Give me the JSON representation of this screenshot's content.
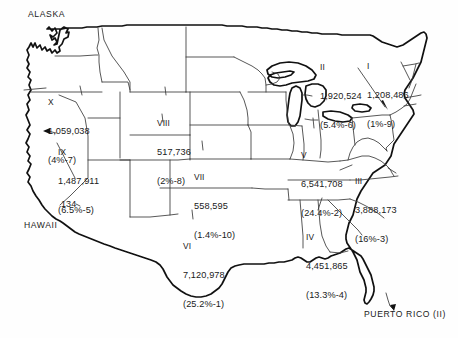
{
  "map": {
    "title": "United States Federal Regions Map",
    "regions": [
      {
        "id": "i",
        "roman": "I",
        "count": "1,208,486",
        "pct_rank": "(1%-9)",
        "percent": 1.0,
        "rank": 9,
        "value": 1208486
      },
      {
        "id": "ii",
        "roman": "II",
        "count": "1,920,524",
        "pct_rank": "(5.4%-6)",
        "percent": 5.4,
        "rank": 6,
        "value": 1920524
      },
      {
        "id": "iii",
        "roman": "III",
        "count": "3,888,173",
        "pct_rank": "(16%-3)",
        "percent": 16.0,
        "rank": 3,
        "value": 3888173
      },
      {
        "id": "iv",
        "roman": "IV",
        "count": "4,451,865",
        "pct_rank": "(13.3%-4)",
        "percent": 13.3,
        "rank": 4,
        "value": 4451865
      },
      {
        "id": "v",
        "roman": "V",
        "count": "6,541,708",
        "pct_rank": "(24.4%-2)",
        "percent": 24.4,
        "rank": 2,
        "value": 6541708
      },
      {
        "id": "vi",
        "roman": "VI",
        "count": "7,120,978",
        "pct_rank": "(25.2%-1)",
        "percent": 25.2,
        "rank": 1,
        "value": 7120978
      },
      {
        "id": "vii",
        "roman": "VII",
        "count": "558,595",
        "pct_rank": "(1.4%-10)",
        "percent": 1.4,
        "rank": 10,
        "value": 558595
      },
      {
        "id": "viii",
        "roman": "VIII",
        "count": "517,736",
        "pct_rank": "(2%-8)",
        "percent": 2.0,
        "rank": 8,
        "value": 517736
      },
      {
        "id": "ix",
        "roman": "IX",
        "count": "1,487,911",
        "pct_rank": "(6.5%-5)",
        "percent": 6.5,
        "rank": 5,
        "value": 1487911
      },
      {
        "id": "x",
        "roman": "X",
        "count": "1,059,038",
        "pct_rank": "(4%-7)",
        "percent": 4.0,
        "rank": 7,
        "value": 1059038
      }
    ],
    "annotations": {
      "alaska": "ALASKA",
      "hawaii": "HAWAII",
      "hawaii_value": "134",
      "puerto_rico": "PUERTO RICO (II)"
    },
    "colors": {
      "background": "#fefefe",
      "coastline": "#111111",
      "state_border": "#3a3a3a",
      "text": "#1a1a1a"
    }
  }
}
